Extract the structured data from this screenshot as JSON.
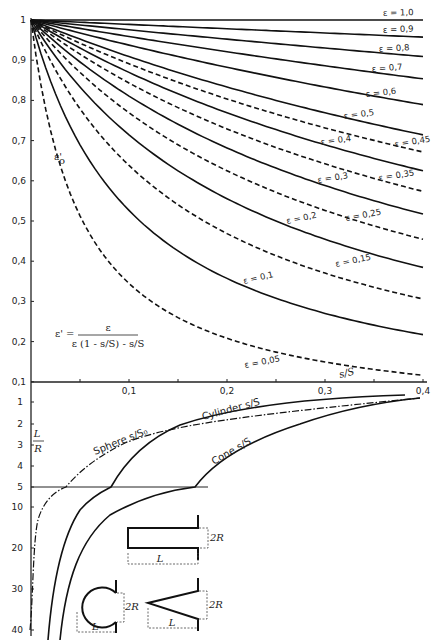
{
  "chart_data": [
    {
      "type": "line",
      "title": "",
      "xlabel": "s/S",
      "ylabel": "ε'₀",
      "xlim": [
        0,
        0.4
      ],
      "ylim": [
        0.1,
        1.0
      ],
      "grid": false,
      "x_ticks": [
        "0,1",
        "0,2",
        "0,3",
        "0,4"
      ],
      "y_ticks": [
        "0,1",
        "0,2",
        "0,3",
        "0,4",
        "0,5",
        "0,6",
        "0,7",
        "0,8",
        "0,9",
        "1"
      ],
      "formula": {
        "lhs": "ε' =",
        "numerator": "ε",
        "denominator": "ε (1 - s/S) - s/S"
      },
      "x": [
        0,
        0.05,
        0.1,
        0.15,
        0.2,
        0.25,
        0.3,
        0.35,
        0.4
      ],
      "series": [
        {
          "name": "ε = 1,0",
          "style": "solid",
          "values": [
            1.0,
            1.0,
            1.0,
            1.0,
            1.0,
            1.0,
            1.0,
            1.0,
            1.0
          ]
        },
        {
          "name": "ε = 0,9",
          "style": "solid",
          "values": [
            1.0,
            0.995,
            0.989,
            0.982,
            0.978,
            0.973,
            0.968,
            0.963,
            0.957
          ]
        },
        {
          "name": "ε = 0,8",
          "style": "solid",
          "values": [
            1.0,
            0.988,
            0.976,
            0.964,
            0.952,
            0.941,
            0.93,
            0.92,
            0.909
          ]
        },
        {
          "name": "ε = 0,7",
          "style": "solid",
          "values": [
            1.0,
            0.979,
            0.959,
            0.94,
            0.921,
            0.903,
            0.886,
            0.87,
            0.854
          ]
        },
        {
          "name": "ε = 0,6",
          "style": "solid",
          "values": [
            1.0,
            0.968,
            0.938,
            0.909,
            0.882,
            0.857,
            0.833,
            0.811,
            0.789
          ]
        },
        {
          "name": "ε = 0,5",
          "style": "solid",
          "values": [
            1.0,
            0.952,
            0.909,
            0.87,
            0.833,
            0.8,
            0.769,
            0.741,
            0.714
          ]
        },
        {
          "name": "ε = 0,45",
          "style": "dashed",
          "values": [
            1.0,
            0.942,
            0.891,
            0.845,
            0.804,
            0.766,
            0.732,
            0.701,
            0.672
          ]
        },
        {
          "name": "ε = 0,4",
          "style": "solid",
          "values": [
            1.0,
            0.93,
            0.87,
            0.816,
            0.769,
            0.727,
            0.69,
            0.656,
            0.625
          ]
        },
        {
          "name": "ε = 0,35",
          "style": "dashed",
          "values": [
            1.0,
            0.915,
            0.843,
            0.782,
            0.729,
            0.683,
            0.642,
            0.606,
            0.574
          ]
        },
        {
          "name": "ε = 0,3",
          "style": "solid",
          "values": [
            1.0,
            0.896,
            0.811,
            0.742,
            0.682,
            0.632,
            0.588,
            0.55,
            0.517
          ]
        },
        {
          "name": "ε = 0,25",
          "style": "dashed",
          "values": [
            1.0,
            0.87,
            0.769,
            0.69,
            0.625,
            0.571,
            0.526,
            0.488,
            0.455
          ]
        },
        {
          "name": "ε = 0,2",
          "style": "solid",
          "values": [
            1.0,
            0.833,
            0.714,
            0.625,
            0.556,
            0.5,
            0.455,
            0.417,
            0.385
          ]
        },
        {
          "name": "ε = 0,15",
          "style": "dashed",
          "values": [
            1.0,
            0.779,
            0.638,
            0.541,
            0.469,
            0.414,
            0.371,
            0.336,
            0.306
          ]
        },
        {
          "name": "ε = 0,1",
          "style": "solid",
          "values": [
            1.0,
            0.69,
            0.526,
            0.426,
            0.357,
            0.308,
            0.27,
            0.241,
            0.217
          ]
        },
        {
          "name": "ε = 0,05",
          "style": "dashed",
          "values": [
            1.0,
            0.513,
            0.345,
            0.26,
            0.208,
            0.174,
            0.149,
            0.131,
            0.116
          ]
        }
      ]
    },
    {
      "type": "line",
      "title": "",
      "xlabel": "s/S",
      "ylabel": "L/R",
      "xlim": [
        0,
        0.4
      ],
      "y_scale": "split: linear 1–5, then 5–40",
      "y_ticks": [
        "1",
        "2",
        "3",
        "4",
        "5",
        "10",
        "20",
        "30",
        "40"
      ],
      "reference_line": {
        "at_LR": 5
      },
      "series": [
        {
          "name": "Cylinder s/S",
          "style": "solid",
          "points": [
            [
              0.019,
              40
            ],
            [
              0.04,
              20
            ],
            [
              0.082,
              5
            ],
            [
              0.13,
              3
            ],
            [
              0.22,
              1.8
            ],
            [
              0.38,
              1.1
            ]
          ]
        },
        {
          "name": "Cone s/S",
          "style": "solid",
          "points": [
            [
              0.03,
              40
            ],
            [
              0.08,
              15
            ],
            [
              0.168,
              5
            ],
            [
              0.22,
              3.5
            ],
            [
              0.3,
              2.1
            ],
            [
              0.4,
              1.4
            ]
          ]
        },
        {
          "name": "Sphere s/S₀",
          "style": "dash-dot",
          "points": [
            [
              0.0,
              40
            ],
            [
              0.015,
              10
            ],
            [
              0.036,
              5
            ],
            [
              0.07,
              4
            ],
            [
              0.12,
              2.7
            ],
            [
              0.22,
              2.1
            ],
            [
              0.4,
              1.5
            ]
          ]
        }
      ],
      "annotations": [
        "Sphere s/S₀",
        "Cylinder s/S",
        "Cone s/S"
      ],
      "inset_shapes": [
        {
          "name": "cylinder-cavity",
          "labels": [
            "L",
            "2R"
          ]
        },
        {
          "name": "sphere-cavity",
          "labels": [
            "L",
            "2R"
          ]
        },
        {
          "name": "cone-cavity",
          "labels": [
            "L",
            "2R"
          ]
        }
      ]
    }
  ],
  "labels": {
    "y_axis_top": "ε'",
    "y_axis_top_sub": "o",
    "y_axis_bottom_num": "L",
    "y_axis_bottom_den": "R",
    "x_axis": "s/S",
    "formula_lhs": "ε' =",
    "formula_num": "ε",
    "formula_den": "ε (1 - s/S) - s/S",
    "sphere": "Sphere",
    "sphere_sub": "s/S₀",
    "cylinder": "Cylinder",
    "cylinder_sub": "s/S",
    "cone": "Cone",
    "cone_sub": "s/S",
    "L": "L",
    "twoR": "2R"
  }
}
